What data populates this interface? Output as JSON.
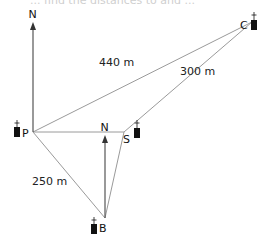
{
  "cut_off_text": "... find the distances to and ...",
  "points": {
    "P": {
      "label": "P",
      "x": 33,
      "y": 132
    },
    "S": {
      "label": "S",
      "x": 124,
      "y": 132
    },
    "C": {
      "label": "C",
      "x": 252,
      "y": 22
    },
    "B": {
      "label": "B",
      "x": 105,
      "y": 218
    }
  },
  "north_arrows": [
    {
      "label": "N",
      "at": "P"
    },
    {
      "label": "N",
      "at": "B"
    }
  ],
  "distances": {
    "PC": "440 m",
    "SC": "300 m",
    "PB": "250 m"
  },
  "colors": {
    "line": "#9a9a9a",
    "arrow": "#444444",
    "marker": "#111111"
  }
}
